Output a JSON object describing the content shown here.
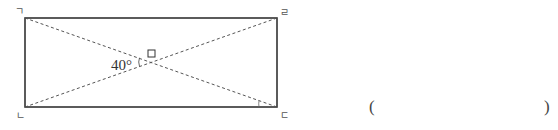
{
  "figure": {
    "shape": "rectangle",
    "vertices": {
      "top_left": "ㄱ",
      "top_right": "ㄹ",
      "bottom_left": "ㄴ",
      "bottom_right": "ㄷ"
    },
    "diagonals": [
      "ㄱㄷ",
      "ㄴㄹ"
    ],
    "known_angle": "40°",
    "unknown_angle_marker": "□"
  },
  "answer": {
    "open_paren": "(",
    "close_paren": ")"
  },
  "colors": {
    "line": "#333333",
    "dashed": "#555555"
  }
}
